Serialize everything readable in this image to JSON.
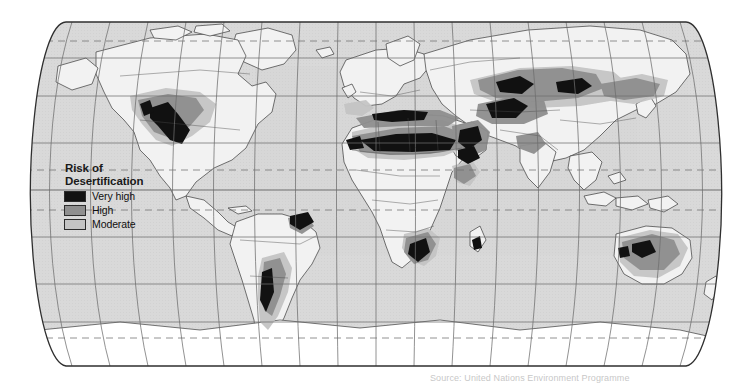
{
  "map": {
    "title": "World map of desertification risk",
    "projection": "Robinson",
    "background_color": "#ffffff",
    "ocean_color": "#d9d9d9",
    "land_color": "#f2f2f2",
    "outline_color": "#3a3a3a",
    "graticule_color": "#6e6e6e",
    "antarctica_color": "#ffffff"
  },
  "legend": {
    "title_line1": "Risk of",
    "title_line2": "Desertification",
    "items": [
      {
        "label": "Very high",
        "color": "#121212"
      },
      {
        "label": "High",
        "color": "#8f8f8f"
      },
      {
        "label": "Moderate",
        "color": "#c4c4c4"
      }
    ]
  },
  "caption": {
    "text": "Source: United Nations Environment Programme"
  }
}
